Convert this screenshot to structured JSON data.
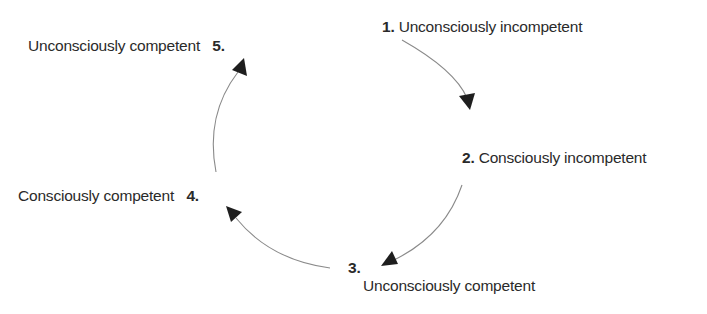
{
  "diagram": {
    "type": "cycle",
    "stages": [
      {
        "number": "1.",
        "label": "Unconsciously incompetent"
      },
      {
        "number": "2.",
        "label": "Consciously incompetent"
      },
      {
        "number": "3.",
        "label": "Unconsciously competent"
      },
      {
        "number": "4.",
        "label": "Consciously competent"
      },
      {
        "number": "5.",
        "label": "Unconsciously competent"
      }
    ],
    "arrows": [
      {
        "from": "1",
        "to": "2"
      },
      {
        "from": "2",
        "to": "3"
      },
      {
        "from": "3",
        "to": "4"
      },
      {
        "from": "4",
        "to": "5"
      }
    ],
    "colors": {
      "line": "#8a8a8a",
      "arrowhead": "#1e1e1e",
      "text": "#2a2a2a"
    }
  }
}
